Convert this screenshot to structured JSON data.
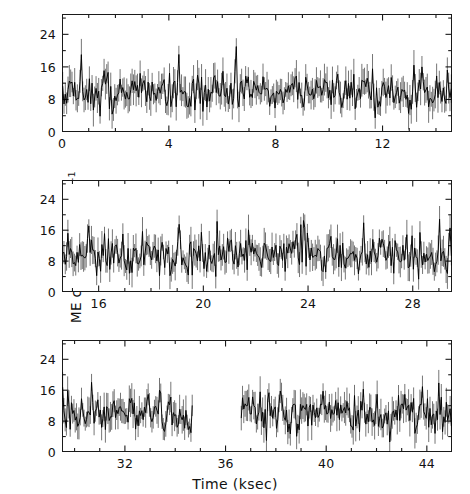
{
  "figure": {
    "axis_labels": {
      "x": "Time (ksec)",
      "y_main": "ME counts sec",
      "y_sup1": "-1",
      "y_mid": " half",
      "y_sup2": "-1",
      "y_full": "ME counts sec-1 half-1"
    },
    "colors": {
      "ink": "#1a1a1a",
      "background": "#ffffff",
      "data": "#000000"
    }
  },
  "chart_data": {
    "type": "line",
    "title": "",
    "subtitle": "",
    "xlabel": "Time (ksec)",
    "ylabel": "ME counts sec^-1 half^-1",
    "grid": false,
    "legend": null,
    "annotations": [
      {
        "text": "data gap",
        "panel": 3,
        "x_start": 34.7,
        "x_end": 36.6
      }
    ],
    "panels": [
      {
        "index": 1,
        "xlim": [
          0,
          14.6
        ],
        "ylim": [
          0,
          29
        ],
        "xticks_major": [
          0,
          4,
          8,
          12
        ],
        "xticks_major_labels": [
          "0",
          "4",
          "8",
          "12"
        ],
        "xtick_minor_step": 1,
        "yticks": [
          0,
          8,
          16,
          24
        ],
        "ytick_labels": [
          "0",
          "8",
          "16",
          "24"
        ],
        "mean_level": 9.6,
        "scatter_sigma": 3.0,
        "errbar_sigma": 3.1,
        "n_points": 292,
        "seed": 17,
        "gaps": []
      },
      {
        "index": 2,
        "xlim": [
          14.6,
          29.5
        ],
        "ylim": [
          0,
          29
        ],
        "xticks_major": [
          16,
          20,
          24,
          28
        ],
        "xticks_major_labels": [
          "16",
          "20",
          "24",
          "28"
        ],
        "xtick_minor_step": 1,
        "yticks": [
          0,
          8,
          16,
          24
        ],
        "ytick_labels": [
          "0",
          "8",
          "16",
          "24"
        ],
        "mean_level": 9.4,
        "scatter_sigma": 3.0,
        "errbar_sigma": 3.1,
        "n_points": 298,
        "seed": 73,
        "gaps": []
      },
      {
        "index": 3,
        "xlim": [
          29.5,
          45.0
        ],
        "ylim": [
          0,
          29
        ],
        "xticks_major": [
          32,
          36,
          40,
          44
        ],
        "xticks_major_labels": [
          "32",
          "36",
          "40",
          "44"
        ],
        "xtick_minor_step": 1,
        "yticks": [
          0,
          8,
          16,
          24
        ],
        "ytick_labels": [
          "0",
          "8",
          "16",
          "24"
        ],
        "mean_level": 10.2,
        "scatter_sigma": 3.1,
        "errbar_sigma": 3.2,
        "n_points": 310,
        "seed": 131,
        "gaps": [
          [
            34.7,
            36.6
          ]
        ]
      }
    ]
  }
}
